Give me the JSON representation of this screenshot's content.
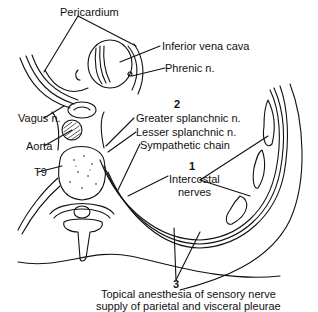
{
  "diagram": {
    "type": "anatomical cross-section",
    "labels": {
      "pericardium": "Pericardium",
      "inferior_vena_cava": "Inferior vena cava",
      "phrenic": "Phrenic n.",
      "vagus": "Vagus n.",
      "aorta": "Aorta",
      "t9": "T9",
      "greater_splanchnic": "Greater splanchnic n.",
      "lesser_splanchnic": "Lesser splanchnic n.",
      "sympathetic_chain": "Sympathetic chain",
      "intercostal_line1": "Intercostal",
      "intercostal_line2": "nerves",
      "topical_line1": "Topical anesthesia of sensory nerve",
      "topical_line2": "supply of parietal and visceral pleurae"
    },
    "markers": {
      "one": "1",
      "two": "2",
      "three": "3"
    },
    "colors": {
      "ink": "#111111",
      "background": "#ffffff"
    }
  }
}
